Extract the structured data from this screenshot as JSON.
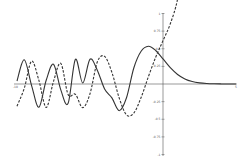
{
  "chart_data": {
    "type": "line",
    "title": "",
    "xlabel": "",
    "ylabel": "",
    "xlim": [
      -10,
      5
    ],
    "ylim": [
      -1,
      1
    ],
    "grid": false,
    "legend": null,
    "x_ticks": [
      "-10",
      "5"
    ],
    "y_ticks": [
      "1",
      "0.75",
      "0.5",
      "0.25",
      "-0.25",
      "-0.5",
      "-0.75",
      "-1"
    ],
    "series": [
      {
        "name": "Ai(x)",
        "style": "solid",
        "x": [
          -10,
          -9.5,
          -9,
          -8.5,
          -8,
          -7.5,
          -7,
          -6.5,
          -6,
          -5.5,
          -5,
          -4.5,
          -4,
          -3.5,
          -3,
          -2.5,
          -2,
          -1.5,
          -1,
          -0.5,
          0,
          0.5,
          1,
          1.5,
          2,
          2.5,
          3,
          3.5,
          4,
          4.5,
          5
        ],
        "y": [
          0.0424,
          0.3438,
          -0.0221,
          -0.3297,
          0.0536,
          0.2812,
          -0.0833,
          -0.2745,
          0.3495,
          0.0145,
          0.3508,
          0.196,
          -0.0702,
          -0.1971,
          -0.3788,
          -0.1954,
          0.2274,
          0.4642,
          0.5356,
          0.4757,
          0.355,
          0.2317,
          0.1353,
          0.0718,
          0.0349,
          0.0158,
          0.0066,
          0.0026,
          0.001,
          0.0003,
          0.0001
        ]
      },
      {
        "name": "Bi(x)",
        "style": "dashed",
        "x": [
          -10,
          -9.5,
          -9,
          -8.5,
          -8,
          -7.5,
          -7,
          -6.5,
          -6,
          -5.5,
          -5,
          -4.5,
          -4,
          -3.5,
          -3,
          -2.5,
          -2,
          -1.5,
          -1,
          -0.5,
          0,
          0.5,
          1,
          1.5,
          1.75
        ],
        "y": [
          -0.3147,
          -0.0586,
          0.3246,
          0.0512,
          -0.3325,
          0.0356,
          0.2931,
          -0.1496,
          -0.1466,
          -0.3359,
          -0.1383,
          0.3128,
          0.3921,
          0.1654,
          -0.1982,
          -0.4383,
          -0.4123,
          -0.1918,
          0.104,
          0.3802,
          0.6149,
          0.8543,
          1.2074,
          1.8789,
          2.4
        ]
      }
    ]
  }
}
